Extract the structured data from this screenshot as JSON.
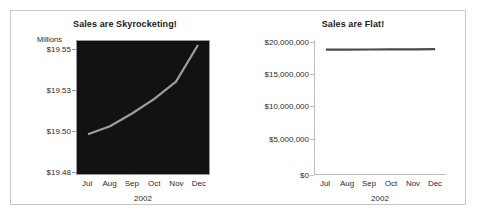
{
  "figure": {
    "background": "#ffffff",
    "border_color": "#c8c8c8"
  },
  "chart_data": [
    {
      "type": "line",
      "panel": "left",
      "title": "Sales are Skyrocketing!",
      "xlabel": "2002",
      "ylabel": "",
      "unit_label": "Millions",
      "categories": [
        "Jul",
        "Aug",
        "Sep",
        "Oct",
        "Nov",
        "Dec"
      ],
      "values": [
        19.5,
        19.505,
        19.513,
        19.522,
        19.533,
        19.556
      ],
      "ytick_labels": [
        "$19.55",
        "$19.53",
        "$19.50",
        "$19.48"
      ],
      "ytick_values": [
        19.55,
        19.53,
        19.5,
        19.48
      ],
      "ylim": [
        19.475,
        19.5585
      ],
      "grid": false,
      "legend": "none",
      "plot_background": "#121212",
      "line_color": "#9d9d9d"
    },
    {
      "type": "line",
      "panel": "right",
      "title": "Sales are Flat!",
      "xlabel": "2002",
      "ylabel": "",
      "unit_label": "",
      "categories": [
        "Jul",
        "Aug",
        "Sep",
        "Oct",
        "Nov",
        "Dec"
      ],
      "values": [
        19500000,
        19505000,
        19513000,
        19522000,
        19533000,
        19556000
      ],
      "ytick_labels": [
        "$20,000,000",
        "$15,000,000",
        "$10,000,000",
        "$5,000,000",
        "$0"
      ],
      "ytick_values": [
        20000000,
        15000000,
        10000000,
        5000000,
        0
      ],
      "ylim": [
        0,
        21000000
      ],
      "grid": false,
      "legend": "none",
      "plot_background": "#ffffff",
      "line_color": "#4a4a4a"
    }
  ]
}
